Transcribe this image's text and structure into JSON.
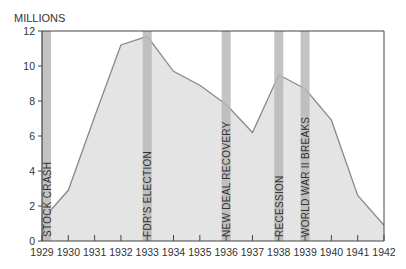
{
  "chart_data": {
    "type": "area",
    "title": "",
    "ylabel": "MILLIONS",
    "xlabel": "",
    "ylim": [
      0,
      12
    ],
    "yticks": [
      0,
      2,
      4,
      6,
      8,
      10,
      12
    ],
    "x": [
      1929,
      1930,
      1931,
      1932,
      1933,
      1934,
      1935,
      1936,
      1937,
      1938,
      1939,
      1940,
      1941,
      1942
    ],
    "series": [
      {
        "name": "Unemployed (millions)",
        "values": [
          1.2,
          2.9,
          7.1,
          11.2,
          11.7,
          9.7,
          8.9,
          7.8,
          6.2,
          9.5,
          8.7,
          6.9,
          2.6,
          0.9
        ]
      }
    ],
    "annotations": [
      {
        "year": 1929,
        "label": "STOCK CRASH"
      },
      {
        "year": 1933,
        "label": "FDR'S  ELECTION"
      },
      {
        "year": 1936,
        "label": "NEW DEAL RECOVERY"
      },
      {
        "year": 1938,
        "label": "RECESSION"
      },
      {
        "year": 1939,
        "label": "WORLD  WAR  II  BREAKS"
      }
    ],
    "grid": false,
    "legend": "none"
  },
  "colors": {
    "fill": "#e4e4e4",
    "line": "#8a8a8a",
    "band": "#b9b9b9",
    "axis": "#444444"
  }
}
